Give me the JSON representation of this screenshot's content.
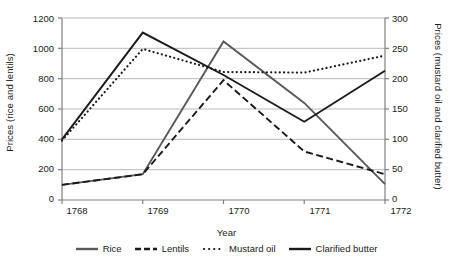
{
  "chart_data": {
    "type": "line",
    "title": "",
    "xlabel": "Year",
    "ylabel": "Prices (rice and lentils)",
    "ylabel_right": "Prices (mustard oil and clarified butter)",
    "categories": [
      "1768",
      "1769",
      "1770",
      "1771",
      "1772"
    ],
    "ylim": [
      0,
      1200
    ],
    "yticks": [
      "0",
      "200",
      "400",
      "600",
      "800",
      "1000",
      "1200"
    ],
    "ylim_right": [
      0,
      300
    ],
    "yticks_right": [
      "0",
      "50",
      "100",
      "150",
      "200",
      "250",
      "300"
    ],
    "grid": true,
    "legend_position": "bottom",
    "series": [
      {
        "name": "Rice",
        "axis": "left",
        "style": "solid",
        "color": "#595959",
        "values": [
          100,
          170,
          1045,
          640,
          105
        ]
      },
      {
        "name": "Lentils",
        "axis": "left",
        "style": "dashed",
        "color": "#1a1a1a",
        "values": [
          100,
          170,
          790,
          320,
          170
        ]
      },
      {
        "name": "Mustard oil",
        "axis": "right",
        "style": "dotted",
        "color": "#1a1a1a",
        "values": [
          98,
          249,
          211,
          210,
          238
        ]
      },
      {
        "name": "Clarified butter",
        "axis": "right",
        "style": "solid",
        "color": "#1a1a1a",
        "values": [
          100,
          276,
          206,
          129,
          213
        ]
      }
    ]
  },
  "legend": {
    "items": [
      {
        "label": "Rice",
        "icon": "line-solid-gray-icon"
      },
      {
        "label": "Lentils",
        "icon": "line-dashed-icon"
      },
      {
        "label": "Mustard oil",
        "icon": "line-dotted-icon"
      },
      {
        "label": "Clarified butter",
        "icon": "line-solid-black-icon"
      }
    ]
  }
}
